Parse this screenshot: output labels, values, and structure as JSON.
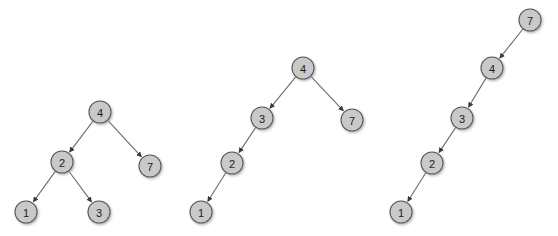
{
  "figure": {
    "title": "",
    "background_color": "#ffffff",
    "node_fill_color": "#c9c9c9",
    "node_stroke_color": "#5a5a5a",
    "edge_color": "#6b6b6b",
    "label_color": "#1b1b1b",
    "node_radius": 11,
    "width": 558,
    "height": 236
  },
  "diagrams": [
    {
      "id": "tree-left",
      "name": "balanced-binary-tree",
      "caption": "",
      "nodes": [
        {
          "id": "L4",
          "label": "4",
          "x": 100,
          "y": 112
        },
        {
          "id": "L2",
          "label": "2",
          "x": 62,
          "y": 162
        },
        {
          "id": "L7",
          "label": "7",
          "x": 150,
          "y": 166
        },
        {
          "id": "L1",
          "label": "1",
          "x": 26,
          "y": 212
        },
        {
          "id": "L3",
          "label": "3",
          "x": 99,
          "y": 212
        }
      ],
      "edges": [
        {
          "from": "L4",
          "to": "L2",
          "directed": true
        },
        {
          "from": "L4",
          "to": "L7",
          "directed": true
        },
        {
          "from": "L2",
          "to": "L1",
          "directed": true
        },
        {
          "from": "L2",
          "to": "L3",
          "directed": true
        }
      ]
    },
    {
      "id": "tree-middle",
      "name": "left-leaning-binary-tree",
      "caption": "",
      "nodes": [
        {
          "id": "M4",
          "label": "4",
          "x": 303,
          "y": 68
        },
        {
          "id": "M3",
          "label": "3",
          "x": 262,
          "y": 118
        },
        {
          "id": "M7",
          "label": "7",
          "x": 352,
          "y": 120
        },
        {
          "id": "M2",
          "label": "2",
          "x": 232,
          "y": 163
        },
        {
          "id": "M1",
          "label": "1",
          "x": 201,
          "y": 212
        }
      ],
      "edges": [
        {
          "from": "M4",
          "to": "M3",
          "directed": true
        },
        {
          "from": "M4",
          "to": "M7",
          "directed": true
        },
        {
          "from": "M3",
          "to": "M2",
          "directed": true
        },
        {
          "from": "M2",
          "to": "M1",
          "directed": true
        }
      ]
    },
    {
      "id": "tree-right",
      "name": "degenerate-left-chain-tree",
      "caption": "",
      "nodes": [
        {
          "id": "R7",
          "label": "7",
          "x": 530,
          "y": 20
        },
        {
          "id": "R4",
          "label": "4",
          "x": 492,
          "y": 68
        },
        {
          "id": "R3",
          "label": "3",
          "x": 462,
          "y": 118
        },
        {
          "id": "R2",
          "label": "2",
          "x": 432,
          "y": 163
        },
        {
          "id": "R1",
          "label": "1",
          "x": 401,
          "y": 212
        }
      ],
      "edges": [
        {
          "from": "R7",
          "to": "R4",
          "directed": true
        },
        {
          "from": "R4",
          "to": "R3",
          "directed": true
        },
        {
          "from": "R3",
          "to": "R2",
          "directed": true
        },
        {
          "from": "R2",
          "to": "R1",
          "directed": true
        }
      ]
    }
  ]
}
